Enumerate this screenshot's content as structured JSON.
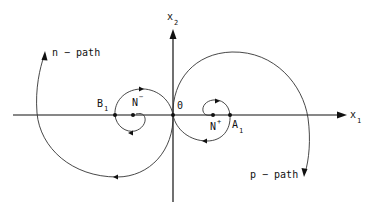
{
  "diagram": {
    "type": "phase-plane-trajectories",
    "axes": {
      "horizontal": {
        "label": "x",
        "subscript": "1"
      },
      "vertical": {
        "label": "x",
        "subscript": "2"
      }
    },
    "points": {
      "origin": {
        "label": "0"
      },
      "n_minus": {
        "label": "N",
        "superscript": "−"
      },
      "n_plus": {
        "label": "N",
        "superscript": "+"
      },
      "b1": {
        "label": "B",
        "subscript": "1"
      },
      "a1": {
        "label": "A",
        "subscript": "1"
      }
    },
    "paths": {
      "n_path": {
        "label": "n − path"
      },
      "p_path": {
        "label": "p − path"
      }
    },
    "colors": {
      "line": "#333333",
      "axis": "#111111",
      "background": "#ffffff"
    }
  }
}
